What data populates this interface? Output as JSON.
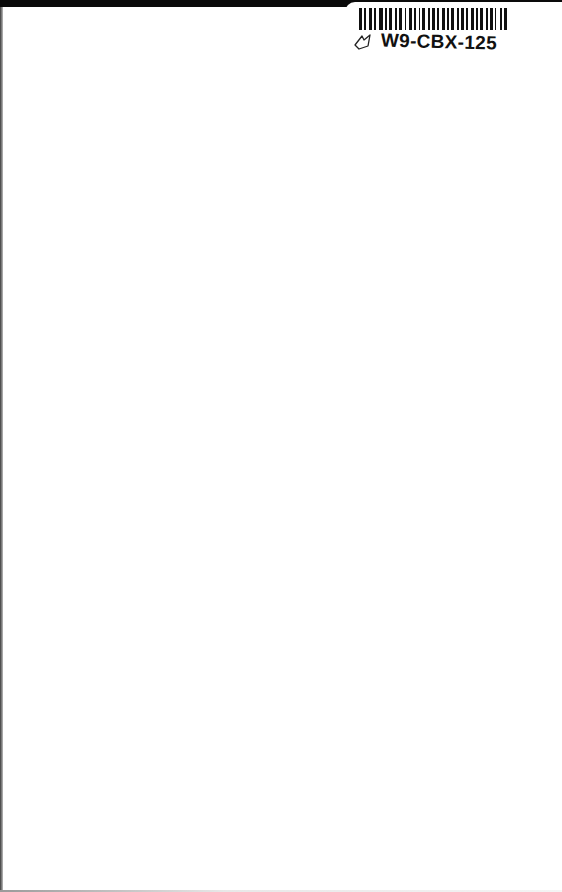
{
  "page": {
    "background": "#ffffff",
    "top_bar_color": "#0a0a0a"
  },
  "sticker": {
    "code": "W9-CBX-125",
    "icon": "leaf-outline-icon",
    "barcode_color": "#111111"
  }
}
